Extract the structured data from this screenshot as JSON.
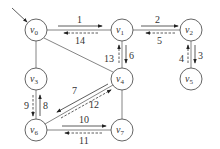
{
  "nodes": [
    {
      "id": "v0",
      "label": "v",
      "sub": "0",
      "x": 36,
      "y": 30
    },
    {
      "id": "v1",
      "label": "v",
      "sub": "1",
      "x": 122,
      "y": 30
    },
    {
      "id": "v2",
      "label": "v",
      "sub": "2",
      "x": 191,
      "y": 30
    },
    {
      "id": "v3",
      "label": "v",
      "sub": "3",
      "x": 36,
      "y": 79
    },
    {
      "id": "v4",
      "label": "v",
      "sub": "4",
      "x": 122,
      "y": 79
    },
    {
      "id": "v5",
      "label": "v",
      "sub": "5",
      "x": 191,
      "y": 79
    },
    {
      "id": "v6",
      "label": "v",
      "sub": "6",
      "x": 36,
      "y": 130
    },
    {
      "id": "v7",
      "label": "v",
      "sub": "7",
      "x": 122,
      "y": 130
    }
  ],
  "edges": [
    [
      "v0",
      "v1"
    ],
    [
      "v1",
      "v2"
    ],
    [
      "v0",
      "v3"
    ],
    [
      "v0",
      "v4"
    ],
    [
      "v1",
      "v4"
    ],
    [
      "v2",
      "v5"
    ],
    [
      "v3",
      "v6"
    ],
    [
      "v4",
      "v6"
    ],
    [
      "v4",
      "v7"
    ],
    [
      "v6",
      "v7"
    ]
  ],
  "traversal_labels": {
    "l1": "1",
    "l2": "2",
    "l3": "3",
    "l4": "4",
    "l5": "5",
    "l6": "6",
    "l7": "7",
    "l8": "8",
    "l9": "9",
    "l10": "10",
    "l11": "11",
    "l12": "12",
    "l13": "13",
    "l14": "14"
  }
}
